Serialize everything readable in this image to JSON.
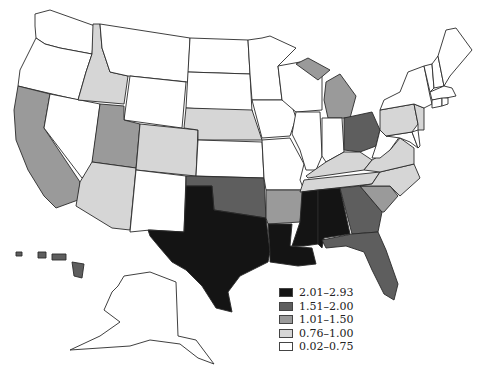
{
  "map": {
    "type": "choropleth",
    "region": "United States",
    "classes": [
      {
        "key": "c5",
        "label": "2.01–2.93",
        "color": "#141414"
      },
      {
        "key": "c4",
        "label": "1.51–2.00",
        "color": "#5e5e5e"
      },
      {
        "key": "c3",
        "label": "1.01–1.50",
        "color": "#9a9a9a"
      },
      {
        "key": "c2",
        "label": "0.76–1.00",
        "color": "#d6d6d6"
      },
      {
        "key": "c1",
        "label": "0.02–0.75",
        "color": "#ffffff"
      }
    ],
    "states": {
      "WA": "c1",
      "OR": "c1",
      "CA": "c3",
      "NV": "c1",
      "ID": "c2",
      "MT": "c1",
      "WY": "c1",
      "UT": "c3",
      "AZ": "c2",
      "CO": "c2",
      "NM": "c1",
      "ND": "c1",
      "SD": "c1",
      "NE": "c2",
      "KS": "c1",
      "OK": "c4",
      "TX": "c5",
      "MN": "c1",
      "IA": "c1",
      "MO": "c1",
      "AR": "c3",
      "LA": "c5",
      "WI": "c1",
      "IL": "c1",
      "MI": "c3",
      "IN": "c1",
      "OH": "c4",
      "KY": "c2",
      "TN": "c2",
      "MS": "c5",
      "AL": "c5",
      "GA": "c4",
      "FL": "c4",
      "SC": "c3",
      "NC": "c2",
      "VA": "c2",
      "WV": "c1",
      "MD": "c1",
      "DE": "c1",
      "PA": "c2",
      "NJ": "c2",
      "NY": "c1",
      "CT": "c1",
      "RI": "c1",
      "MA": "c1",
      "VT": "c1",
      "NH": "c1",
      "ME": "c1",
      "AK": "c1",
      "HI": "c4"
    }
  },
  "legend": {
    "items": [
      "2.01–2.93",
      "1.51–2.00",
      "1.01–1.50",
      "0.76–1.00",
      "0.02–0.75"
    ]
  }
}
